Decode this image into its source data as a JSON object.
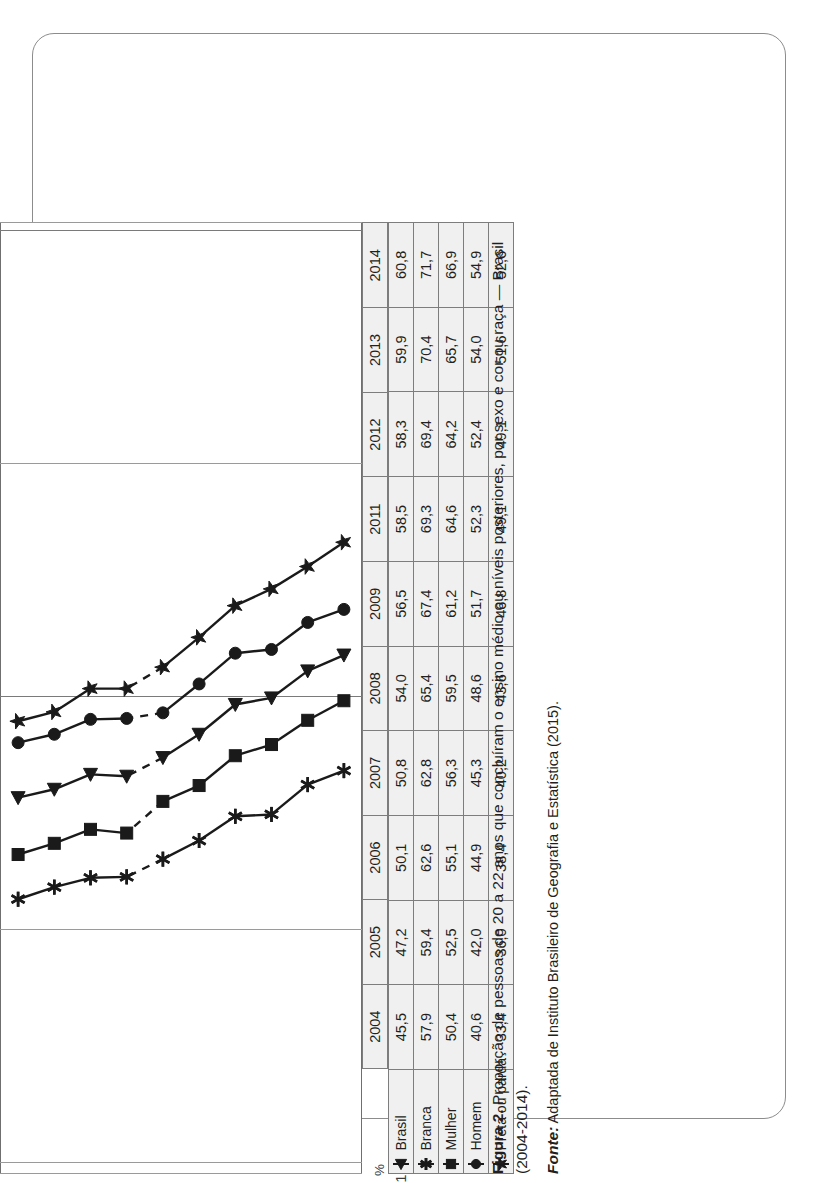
{
  "figure": {
    "number_label": "Figura 2.",
    "title": " Proporção de pessoas de 20 a 22 anos que concluíram o ensino médio ou níveis posteriores, por sexo e cor ou raça — Brasil (2004-2014).",
    "source_label": "Fonte:",
    "source_text": " Adaptada de Instituto Brasileiro de Geografia e Estatística (2015)."
  },
  "axis": {
    "unit_symbol": "%",
    "ticks": [
      "100,0",
      "75,0",
      "50,0",
      "25,0",
      "0,0"
    ]
  },
  "legend": [
    {
      "label": "Brasil",
      "marker": "triangle-left-marker"
    },
    {
      "label": "Branca",
      "marker": "asterisk-marker"
    },
    {
      "label": "Mulher",
      "marker": "square-marker"
    },
    {
      "label": "Homem",
      "marker": "circle-marker"
    },
    {
      "label": "Preta ou parda",
      "marker": "star-marker"
    }
  ],
  "table": {
    "years": [
      "2004",
      "2005",
      "2006",
      "2007",
      "2008",
      "2009",
      "2011",
      "2012",
      "2013",
      "2014"
    ],
    "rows": [
      {
        "label": "Brasil",
        "values": [
          "45,5",
          "47,2",
          "50,1",
          "50,8",
          "54,0",
          "56,5",
          "58,5",
          "58,3",
          "59,9",
          "60,8"
        ]
      },
      {
        "label": "Branca",
        "values": [
          "57,9",
          "59,4",
          "62,6",
          "62,8",
          "65,4",
          "67,4",
          "69,3",
          "69,4",
          "70,4",
          "71,7"
        ]
      },
      {
        "label": "Mulher",
        "values": [
          "50,4",
          "52,5",
          "55,1",
          "56,3",
          "59,5",
          "61,2",
          "64,6",
          "64,2",
          "65,7",
          "66,9"
        ]
      },
      {
        "label": "Homem",
        "values": [
          "40,6",
          "42,0",
          "44,9",
          "45,3",
          "48,6",
          "51,7",
          "52,3",
          "52,4",
          "54,0",
          "54,9"
        ]
      },
      {
        "label": "Preta ou parda",
        "values": [
          "33,4",
          "36,0",
          "38,4",
          "40,2",
          "43,6",
          "46,8",
          "49,1",
          "49,1",
          "51,6",
          "52,6"
        ]
      }
    ]
  },
  "chart_data": {
    "type": "line",
    "title": "Proporção de pessoas de 20 a 22 anos que concluíram o ensino médio ou níveis posteriores, por sexo e cor ou raça — Brasil (2004-2014)",
    "xlabel": "",
    "ylabel": "%",
    "ylim": [
      0,
      100
    ],
    "yticks": [
      0,
      25,
      50,
      75,
      100
    ],
    "grid": true,
    "legend_position": "table-row-headers",
    "x": [
      "2004",
      "2005",
      "2006",
      "2007",
      "2008",
      "2009",
      "2011",
      "2012",
      "2013",
      "2014"
    ],
    "gap_between": [
      "2009",
      "2011"
    ],
    "series": [
      {
        "name": "Brasil",
        "marker": "triangle-left",
        "values": [
          45.5,
          47.2,
          50.1,
          50.8,
          54.0,
          56.5,
          58.5,
          58.3,
          59.9,
          60.8
        ]
      },
      {
        "name": "Branca",
        "marker": "asterisk",
        "values": [
          57.9,
          59.4,
          62.6,
          62.8,
          65.4,
          67.4,
          69.3,
          69.4,
          70.4,
          71.7
        ]
      },
      {
        "name": "Mulher",
        "marker": "square",
        "values": [
          50.4,
          52.5,
          55.1,
          56.3,
          59.5,
          61.2,
          64.6,
          64.2,
          65.7,
          66.9
        ]
      },
      {
        "name": "Homem",
        "marker": "circle",
        "values": [
          40.6,
          42.0,
          44.9,
          45.3,
          48.6,
          51.7,
          52.3,
          52.4,
          54.0,
          54.9
        ]
      },
      {
        "name": "Preta ou parda",
        "marker": "star",
        "values": [
          33.4,
          36.0,
          38.4,
          40.2,
          43.6,
          46.8,
          49.1,
          49.1,
          51.6,
          52.6
        ]
      }
    ]
  }
}
